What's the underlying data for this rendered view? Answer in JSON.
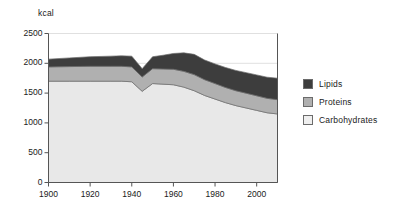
{
  "chart_data": {
    "type": "area",
    "stacked": true,
    "title": "",
    "subtitle": "",
    "xlabel": "",
    "ylabel": "kcal",
    "ylim": [
      0,
      2500
    ],
    "xlim": [
      1900,
      2010
    ],
    "yticks": [
      0,
      500,
      1000,
      1500,
      2000,
      2500
    ],
    "ytick_labels": [
      "0",
      "500",
      "1000",
      "1500",
      "2000",
      "2500"
    ],
    "xticks": [
      1900,
      1920,
      1940,
      1960,
      1980,
      2000
    ],
    "xtick_labels": [
      "1900",
      "1920",
      "1940",
      "1960",
      "1980",
      "2000"
    ],
    "grid": true,
    "grid_axis": "y",
    "legend_position": "right",
    "x": [
      1900,
      1910,
      1920,
      1930,
      1935,
      1940,
      1945,
      1950,
      1955,
      1960,
      1965,
      1970,
      1975,
      1980,
      1985,
      1990,
      1995,
      2000,
      2005,
      2010
    ],
    "series": [
      {
        "name": "Carbohydrates",
        "color": "#e8e8e8",
        "values": [
          1700,
          1700,
          1700,
          1700,
          1700,
          1690,
          1530,
          1660,
          1650,
          1640,
          1600,
          1540,
          1460,
          1400,
          1340,
          1290,
          1250,
          1210,
          1170,
          1150
        ]
      },
      {
        "name": "Proteins",
        "color": "#b0b0b0",
        "values": [
          240,
          245,
          250,
          250,
          250,
          250,
          240,
          250,
          255,
          260,
          265,
          270,
          265,
          260,
          255,
          250,
          248,
          245,
          242,
          240
        ]
      },
      {
        "name": "Lipids",
        "color": "#3d3d3d",
        "values": [
          130,
          145,
          160,
          170,
          175,
          180,
          140,
          200,
          230,
          265,
          310,
          340,
          330,
          330,
          335,
          340,
          345,
          350,
          355,
          360
        ]
      }
    ],
    "series_totals": [
      2070,
      2090,
      2110,
      2120,
      2125,
      2120,
      1910,
      2110,
      2135,
      2165,
      2175,
      2150,
      2055,
      1990,
      1930,
      1880,
      1843,
      1805,
      1767,
      1750
    ],
    "annotations": []
  },
  "legend": {
    "items": [
      {
        "label": "Lipids",
        "color": "#3d3d3d"
      },
      {
        "label": "Proteins",
        "color": "#b0b0b0"
      },
      {
        "label": "Carbohydrates",
        "color": "#efefef"
      }
    ]
  },
  "axes": {
    "y_title": "kcal"
  },
  "colors": {
    "axis": "#555555",
    "grid": "#e0e0e0",
    "text": "#1a1a1a",
    "background": "#ffffff",
    "series_edge": "#6b6b6b"
  }
}
